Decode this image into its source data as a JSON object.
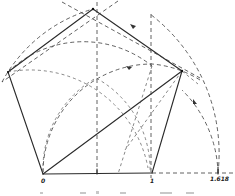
{
  "figure": {
    "type": "geometric-construction",
    "labels": {
      "origin": "0",
      "unit": "1",
      "golden_ratio": "1.618"
    },
    "colors": {
      "ink": "#2a2a2a",
      "construction": "#3a3a3a",
      "background": "#ffffff"
    },
    "elements": {
      "pentagon_edges": [
        "bottom",
        "lower-right",
        "upper-right",
        "upper-left",
        "lower-left"
      ],
      "construction_arcs": [
        "arc-from-origin-radius-phi",
        "arc-from-unit-radius-phi",
        "arc-from-midpoint",
        "circumcircle-top-arc"
      ],
      "construction_lines": [
        "vertical-at-midpoint",
        "vertical-at-unit",
        "diagonal-origin-to-right-vertex",
        "baseline-extension"
      ]
    }
  }
}
